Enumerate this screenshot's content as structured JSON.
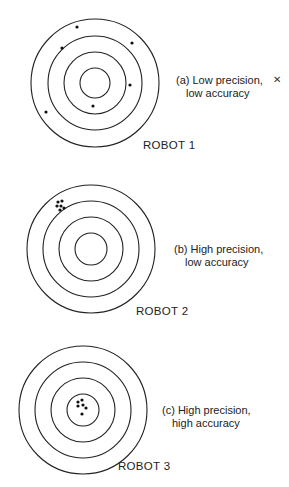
{
  "targets": [
    {
      "robot_label": "ROBOT 1",
      "caption_line1": "(a) Low precision,",
      "caption_line2": "low accuracy",
      "center": [
        95,
        83
      ],
      "radii": [
        64,
        47,
        31,
        15
      ],
      "shots": [
        [
          77,
          27
        ],
        [
          62,
          48
        ],
        [
          132,
          43
        ],
        [
          130,
          85
        ],
        [
          93,
          106
        ],
        [
          46,
          112
        ]
      ]
    },
    {
      "robot_label": "ROBOT 2",
      "caption_line1": "(b) High precision,",
      "caption_line2": "low accuracy",
      "center": [
        91,
        249
      ],
      "radii": [
        64,
        48,
        32,
        16
      ],
      "shots": [
        [
          58,
          202
        ],
        [
          62,
          201
        ],
        [
          57,
          206
        ],
        [
          61,
          206
        ],
        [
          64,
          208
        ],
        [
          60,
          210
        ]
      ]
    },
    {
      "robot_label": "ROBOT 3",
      "caption_line1": "(c) High precision,",
      "caption_line2": "high accuracy",
      "center": [
        83,
        410
      ],
      "radii": [
        64,
        48,
        32,
        16
      ],
      "shots": [
        [
          78,
          402
        ],
        [
          82,
          400
        ],
        [
          78,
          406
        ],
        [
          83,
          405
        ],
        [
          86,
          408
        ],
        [
          82,
          414
        ]
      ]
    }
  ],
  "artifact_glyph": "✕"
}
